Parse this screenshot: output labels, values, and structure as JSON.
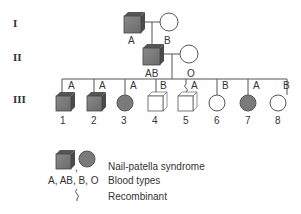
{
  "generations": [
    "I",
    "II",
    "III"
  ],
  "colors": {
    "affected": "#777777",
    "affected_top": "#555555",
    "unaffected": "#ffffff",
    "line": "#555555"
  },
  "gen1": {
    "father": {
      "sex": "male",
      "affected": true,
      "blood": "A"
    },
    "mother": {
      "sex": "female",
      "affected": false,
      "blood": "B"
    }
  },
  "gen2": {
    "father": {
      "sex": "male",
      "affected": true,
      "blood": "AB"
    },
    "mother": {
      "sex": "female",
      "affected": false,
      "blood": "O"
    }
  },
  "gen3": [
    {
      "num": "1",
      "sex": "male",
      "affected": true,
      "blood": "A",
      "recombinant": false
    },
    {
      "num": "2",
      "sex": "male",
      "affected": true,
      "blood": "A",
      "recombinant": false
    },
    {
      "num": "3",
      "sex": "female",
      "affected": true,
      "blood": "A",
      "recombinant": false
    },
    {
      "num": "4",
      "sex": "male",
      "affected": false,
      "blood": "B",
      "recombinant": false
    },
    {
      "num": "5",
      "sex": "male",
      "affected": false,
      "blood": "A",
      "recombinant": true
    },
    {
      "num": "6",
      "sex": "female",
      "affected": false,
      "blood": "B",
      "recombinant": false
    },
    {
      "num": "7",
      "sex": "female",
      "affected": true,
      "blood": "A",
      "recombinant": false
    },
    {
      "num": "8",
      "sex": "female",
      "affected": false,
      "blood": "B",
      "recombinant": false
    }
  ],
  "legend": {
    "affected_label": "Nail-patella syndrome",
    "blood_symbols": "A, AB, B, O",
    "blood_label": "Blood types",
    "recombinant_label": "Recombinant"
  }
}
